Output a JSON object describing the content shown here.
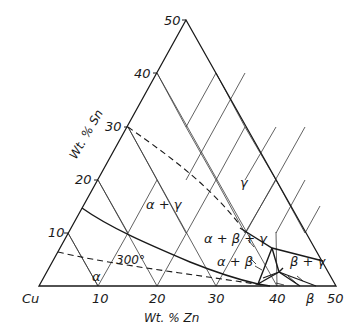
{
  "diagram": {
    "temperature_label": "300°",
    "corner_label": "Cu",
    "axes": {
      "sn_axis_label": "Wt. % Sn",
      "zn_axis_label": "Wt. % Zn",
      "sn_ticks": [
        "10",
        "20",
        "30",
        "40",
        "50"
      ],
      "zn_ticks": [
        "10",
        "20",
        "30",
        "40",
        "50"
      ]
    },
    "phases": {
      "alpha": "α",
      "alpha_gamma": "α + γ",
      "gamma": "γ",
      "alpha_beta_gamma": "α + β + γ",
      "alpha_beta": "α + β",
      "beta_gamma": "β + γ",
      "beta": "β"
    },
    "colors": {
      "ink": "#1a1a1a",
      "grid": "#3a3a3a",
      "background": "#ffffff"
    }
  }
}
